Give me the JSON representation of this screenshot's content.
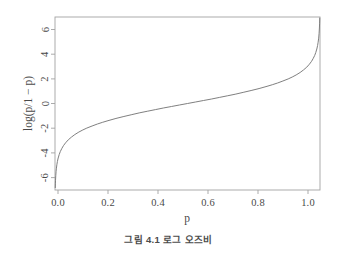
{
  "figure": {
    "caption": "그림 4.1  로그 오즈비",
    "background_color": "#ffffff",
    "line_color": "#777777",
    "axis_color": "#9a9a9a",
    "text_color": "#4a4a4a"
  },
  "chart_data": {
    "type": "line",
    "title": "",
    "subtitle": "",
    "xlabel": "p",
    "ylabel": "log(p/1 − p)",
    "xlim": [
      0.0,
      1.0
    ],
    "ylim": [
      -7.0,
      7.0
    ],
    "grid": false,
    "legend": null,
    "xticks": [
      0.0,
      0.2,
      0.4,
      0.6,
      0.8,
      1.0
    ],
    "xtick_labels": [
      "0.0",
      "0.2",
      "0.4",
      "0.6",
      "0.8",
      "1.0"
    ],
    "yticks": [
      -6,
      -4,
      -2,
      0,
      2,
      4,
      6
    ],
    "ytick_labels": [
      "-6",
      "-4",
      "-2",
      "0",
      "2",
      "4",
      "6"
    ],
    "series": [
      {
        "name": "logit",
        "formula": "log(p/(1-p))",
        "x": [
          0.0011,
          0.0015,
          0.002,
          0.003,
          0.004,
          0.005,
          0.007,
          0.009,
          0.012,
          0.016,
          0.02,
          0.026,
          0.032,
          0.04,
          0.05,
          0.062,
          0.075,
          0.09,
          0.105,
          0.12,
          0.14,
          0.16,
          0.18,
          0.2,
          0.23,
          0.26,
          0.29,
          0.32,
          0.35,
          0.38,
          0.41,
          0.44,
          0.47,
          0.5,
          0.53,
          0.56,
          0.59,
          0.62,
          0.65,
          0.68,
          0.71,
          0.74,
          0.77,
          0.8,
          0.82,
          0.84,
          0.86,
          0.88,
          0.895,
          0.91,
          0.925,
          0.938,
          0.95,
          0.96,
          0.968,
          0.974,
          0.98,
          0.984,
          0.988,
          0.991,
          0.993,
          0.995,
          0.9965,
          0.9978,
          0.9985,
          0.999
        ],
        "y": [
          -6.81,
          -6.5,
          -6.21,
          -5.81,
          -5.52,
          -5.29,
          -4.96,
          -4.7,
          -4.41,
          -4.12,
          -3.89,
          -3.63,
          -3.41,
          -3.18,
          -2.94,
          -2.72,
          -2.51,
          -2.31,
          -2.14,
          -1.99,
          -1.82,
          -1.66,
          -1.52,
          -1.39,
          -1.21,
          -1.05,
          -0.9,
          -0.75,
          -0.62,
          -0.49,
          -0.36,
          -0.24,
          -0.12,
          0.0,
          0.12,
          0.24,
          0.36,
          0.49,
          0.62,
          0.75,
          0.9,
          1.05,
          1.21,
          1.39,
          1.52,
          1.66,
          1.82,
          1.99,
          2.14,
          2.31,
          2.51,
          2.72,
          2.94,
          3.18,
          3.41,
          3.63,
          3.89,
          4.12,
          4.41,
          4.7,
          4.96,
          5.29,
          5.65,
          6.11,
          6.5,
          6.91
        ]
      }
    ]
  }
}
